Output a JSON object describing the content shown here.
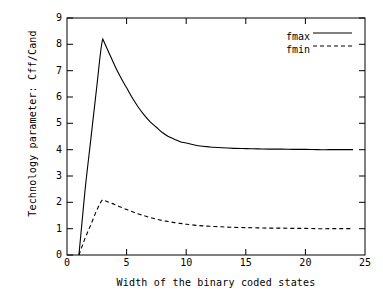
{
  "chart_data": {
    "type": "line",
    "title": "",
    "xlabel": "Width of the binary coded states",
    "ylabel": "Technology parameter: Cff/Cand",
    "xlim": [
      0,
      25
    ],
    "ylim": [
      0,
      9
    ],
    "xticks": [
      0,
      5,
      10,
      15,
      20,
      25
    ],
    "yticks": [
      0,
      1,
      2,
      3,
      4,
      5,
      6,
      7,
      8,
      9
    ],
    "grid": false,
    "legend_position": "top-right",
    "series": [
      {
        "name": "fmax",
        "style": "solid",
        "color": "#000000",
        "x": [
          1,
          1.5,
          2,
          2.5,
          3,
          3.5,
          4,
          4.5,
          5,
          5.5,
          6,
          6.5,
          7,
          7.5,
          8,
          8.5,
          9,
          9.5,
          10,
          11,
          12,
          13,
          14,
          15,
          16,
          17,
          18,
          19,
          20,
          21,
          22,
          23,
          24
        ],
        "y": [
          0.0,
          2.4,
          4.4,
          6.4,
          8.2,
          7.7,
          7.2,
          6.75,
          6.35,
          5.95,
          5.6,
          5.3,
          5.05,
          4.85,
          4.65,
          4.5,
          4.4,
          4.3,
          4.25,
          4.15,
          4.1,
          4.07,
          4.05,
          4.04,
          4.03,
          4.02,
          4.02,
          4.01,
          4.01,
          4.0,
          4.0,
          4.0,
          4.0
        ]
      },
      {
        "name": "fmin",
        "style": "dashed",
        "color": "#000000",
        "x": [
          1,
          1.5,
          2,
          2.5,
          3,
          3.5,
          4,
          4.5,
          5,
          5.5,
          6,
          6.5,
          7,
          7.5,
          8,
          8.5,
          9,
          9.5,
          10,
          11,
          12,
          13,
          14,
          15,
          16,
          17,
          18,
          19,
          20,
          21,
          22,
          23,
          24
        ],
        "y": [
          0.0,
          0.62,
          1.15,
          1.7,
          2.1,
          2.0,
          1.92,
          1.82,
          1.73,
          1.64,
          1.56,
          1.49,
          1.42,
          1.36,
          1.31,
          1.27,
          1.23,
          1.2,
          1.17,
          1.12,
          1.09,
          1.07,
          1.05,
          1.04,
          1.03,
          1.02,
          1.02,
          1.01,
          1.01,
          1.0,
          1.0,
          1.0,
          1.0
        ]
      }
    ],
    "legend": [
      {
        "label": "fmax",
        "style": "solid"
      },
      {
        "label": "fmin",
        "style": "dashed"
      }
    ]
  },
  "axis": {
    "y_tick_labels": [
      "9",
      "8",
      "7",
      "6",
      "5",
      "4",
      "3",
      "2",
      "1",
      "0"
    ],
    "x_tick_labels": [
      "0",
      "5",
      "10",
      "15",
      "20",
      "25"
    ]
  }
}
